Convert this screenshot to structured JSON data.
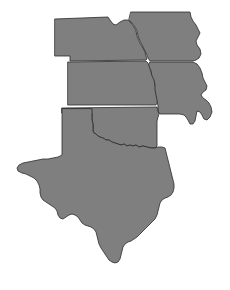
{
  "map": {
    "title": "South Central United States Region Map",
    "background_color": "#ffffff",
    "outline_color": "#2b2b2b",
    "default_fill": "#808080",
    "width": 230,
    "height": 290,
    "projection_note": "plain outline map, no labels rendered",
    "states": [
      {
        "id": "nebraska",
        "name": "Nebraska",
        "fill": "#7f7f7f",
        "path": "M 55 19 L 108 17 L 110 20 L 113 24 L 116 25 L 120 22 L 124 20 L 128 20 L 131 23 L 134 27 L 136 31 L 137 36 L 139 41 L 141 45 L 143 48 L 145 52 L 146 56 L 147 59 L 146 60 L 70 61 L 70 56 L 55 56 Z"
      },
      {
        "id": "iowa",
        "name": "Iowa",
        "fill": "#7f7f7f",
        "path": "M 131 12 L 190 12 L 191 17 L 193 21 L 196 25 L 198 29 L 200 33 L 198 37 L 196 41 L 197 45 L 200 49 L 201 54 L 199 58 L 196 60 L 193 61 L 150 61 L 148 58 L 146 53 L 144 49 L 142 45 L 140 41 L 138 36 L 137 31 L 135 27 L 132 23 L 129 20 Z"
      },
      {
        "id": "kansas",
        "name": "Kansas",
        "fill": "#7f7f7f",
        "path": "M 68 62 L 146 61 L 148 63 L 150 67 L 151 72 L 153 76 L 155 80 L 155 85 L 156 90 L 157 95 L 158 101 L 156 105 L 68 105 Z"
      },
      {
        "id": "missouri",
        "name": "Missouri",
        "fill": "#7f7f7f",
        "path": "M 150 62 L 193 62 L 197 64 L 200 68 L 202 73 L 203 78 L 205 82 L 207 86 L 206 90 L 203 92 L 201 95 L 203 98 L 206 100 L 209 103 L 211 107 L 212 112 L 210 117 L 207 120 L 204 119 L 202 115 L 200 112 L 197 111 L 196 116 L 195 121 L 193 124 L 190 124 L 188 120 L 186 117 L 184 115 L 180 114 L 176 114 L 172 114 L 168 114 L 164 114 L 160 114 L 158 111 L 158 106 L 157 100 L 156 95 L 155 90 L 155 85 L 154 80 L 152 76 L 151 71 L 149 66 Z"
      },
      {
        "id": "oklahoma",
        "name": "Oklahoma",
        "fill": "#7f7f7f",
        "path": "M 62 108 L 157 107 L 158 111 L 159 114 L 158 117 L 157 121 L 157 126 L 157 131 L 157 136 L 157 141 L 157 146 L 155 148 L 151 148 L 147 147 L 143 146 L 139 147 L 136 145 L 133 146 L 130 145 L 127 146 L 124 144 L 121 145 L 118 144 L 115 143 L 112 142 L 109 140 L 106 140 L 103 138 L 100 137 L 98 136 L 96 134 L 94 133 L 93 131 L 93 128 L 93 124 L 92 120 L 92 116 L 92 113 L 62 113 Z"
      },
      {
        "id": "texas",
        "name": "Texas",
        "fill": "#7f7f7f",
        "path": "M 62 109 L 62 155 L 58 157 L 53 158 L 48 159 L 43 159 L 38 160 L 33 161 L 28 162 L 23 163 L 19 165 L 17 168 L 18 171 L 22 173 L 26 174 L 30 176 L 34 178 L 37 181 L 39 185 L 40 189 L 40 193 L 41 197 L 43 200 L 46 202 L 49 204 L 52 206 L 55 208 L 57 211 L 58 215 L 60 218 L 63 219 L 66 217 L 69 215 L 72 214 L 75 215 L 78 217 L 80 220 L 82 223 L 85 225 L 88 226 L 91 227 L 94 229 L 96 232 L 97 236 L 98 240 L 99 244 L 101 248 L 103 251 L 105 254 L 107 257 L 109 260 L 112 262 L 115 263 L 118 262 L 120 259 L 121 255 L 122 251 L 123 247 L 125 244 L 128 242 L 131 241 L 134 239 L 137 237 L 140 234 L 143 231 L 146 228 L 149 225 L 152 222 L 155 219 L 157 215 L 158 211 L 159 207 L 160 203 L 162 200 L 165 198 L 168 197 L 171 195 L 173 192 L 174 188 L 174 184 L 173 180 L 172 176 L 171 172 L 170 168 L 169 164 L 168 160 L 167 156 L 166 152 L 165 148 L 162 147 L 158 147 L 155 148 L 151 148 L 147 147 L 143 146 L 139 147 L 136 145 L 133 146 L 130 145 L 127 146 L 124 144 L 121 145 L 118 144 L 115 143 L 112 142 L 109 140 L 106 140 L 103 138 L 100 137 L 98 136 L 96 134 L 94 133 L 93 131 L 93 128 L 93 124 L 92 120 L 92 116 L 92 113 L 92 109 Z"
      }
    ]
  }
}
